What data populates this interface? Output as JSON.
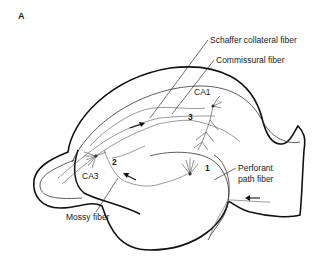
{
  "figure": {
    "panel_label": "A"
  },
  "labels": {
    "schaffer": "Schaffer collateral fiber",
    "commissural": "Commissural fiber",
    "ca1": "CA1",
    "ca3": "CA3",
    "perforant_line1": "Perforant",
    "perforant_line2": "path fiber",
    "mossy": "Mossy fiber"
  },
  "synapse_numbers": {
    "one": "1",
    "two": "2",
    "three": "3"
  },
  "colors": {
    "outline": "#111111",
    "fiber": "#555555",
    "text": "#1a1a1a",
    "background": "#ffffff"
  }
}
